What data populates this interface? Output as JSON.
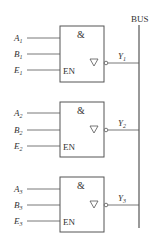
{
  "bus": {
    "label": "BUS"
  },
  "gates": [
    {
      "symbol": "&",
      "enable": "EN",
      "inputs": [
        {
          "name": "A",
          "sub": "1"
        },
        {
          "name": "B",
          "sub": "1"
        },
        {
          "name": "E",
          "sub": "1"
        }
      ],
      "output": {
        "name": "Y",
        "sub": "1"
      }
    },
    {
      "symbol": "&",
      "enable": "EN",
      "inputs": [
        {
          "name": "A",
          "sub": "2"
        },
        {
          "name": "B",
          "sub": "2"
        },
        {
          "name": "E",
          "sub": "2"
        }
      ],
      "output": {
        "name": "Y",
        "sub": "2"
      }
    },
    {
      "symbol": "&",
      "enable": "EN",
      "inputs": [
        {
          "name": "A",
          "sub": "3"
        },
        {
          "name": "B",
          "sub": "3"
        },
        {
          "name": "E",
          "sub": "3"
        }
      ],
      "output": {
        "name": "Y",
        "sub": "3"
      }
    }
  ],
  "colors": {
    "line": "#555555",
    "text": "#333333"
  }
}
